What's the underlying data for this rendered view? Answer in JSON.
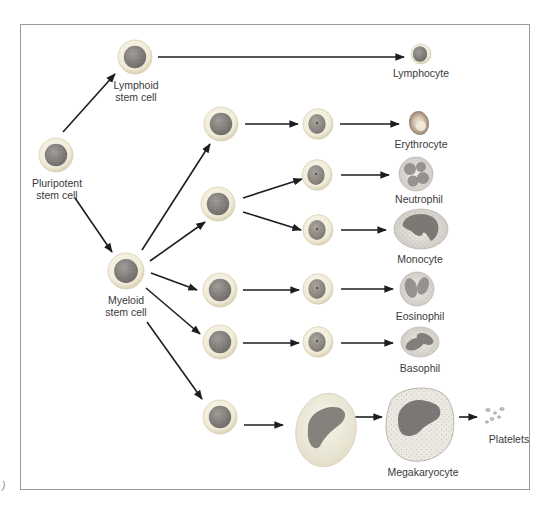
{
  "diagram": {
    "corner_mark": ")",
    "colors": {
      "frame": "#9a9a9a",
      "arrow": "#1e1e1e",
      "cell_halo": "#f1ecd9",
      "cell_halo_edge": "#d8d0b4",
      "stem_nucleus": "#7e7a78",
      "progenitor_nucleus": "#8c8882",
      "erythrocyte": "#b69a86",
      "granulocyte_body": "#e4e0dc",
      "granulocyte_lobes": "#8a8583",
      "megakaryoblast_cytoplasm": "#f2eee0",
      "megakaryocyte_nucleus": "#7a7474",
      "label_text": "#3a3a3a"
    },
    "nodes": [
      {
        "id": "pluripotent",
        "type": "stem",
        "x": 56,
        "y": 155,
        "r": 17,
        "label": "Pluripotent\nstem cell",
        "lx": 57,
        "ly": 177
      },
      {
        "id": "lymphoid",
        "type": "stem",
        "x": 135,
        "y": 57,
        "r": 17,
        "label": "Lymphoid\nstem cell",
        "lx": 136,
        "ly": 79
      },
      {
        "id": "myeloid",
        "type": "stem",
        "x": 126,
        "y": 271,
        "r": 18,
        "label": "Myeloid\nstem cell",
        "lx": 126,
        "ly": 294
      },
      {
        "id": "m1",
        "type": "stem",
        "x": 221,
        "y": 124,
        "r": 17
      },
      {
        "id": "m2",
        "type": "stem",
        "x": 218,
        "y": 204,
        "r": 17
      },
      {
        "id": "m3",
        "type": "stem",
        "x": 220,
        "y": 290,
        "r": 17
      },
      {
        "id": "m4",
        "type": "stem",
        "x": 220,
        "y": 342,
        "r": 17
      },
      {
        "id": "m5",
        "type": "stem",
        "x": 220,
        "y": 417,
        "r": 17
      },
      {
        "id": "p1",
        "type": "progenitor",
        "x": 318,
        "y": 124,
        "r": 15
      },
      {
        "id": "p2",
        "type": "progenitor",
        "x": 317,
        "y": 175,
        "r": 15
      },
      {
        "id": "p3",
        "type": "progenitor",
        "x": 318,
        "y": 230,
        "r": 15
      },
      {
        "id": "p4",
        "type": "progenitor",
        "x": 318,
        "y": 289,
        "r": 15
      },
      {
        "id": "p5",
        "type": "progenitor",
        "x": 318,
        "y": 342,
        "r": 15
      },
      {
        "id": "megakaryoblast",
        "type": "megakaryoblast",
        "x": 326,
        "y": 430
      },
      {
        "id": "lymphocyte",
        "type": "lymphocyte",
        "x": 421,
        "y": 54,
        "label": "Lymphocyte",
        "lx": 421,
        "ly": 67
      },
      {
        "id": "erythrocyte",
        "type": "erythrocyte",
        "x": 419,
        "y": 123,
        "label": "Erythrocyte",
        "lx": 421,
        "ly": 138
      },
      {
        "id": "neutrophil",
        "type": "neutrophil",
        "x": 416,
        "y": 174,
        "label": "Neutrophil",
        "lx": 419,
        "ly": 193
      },
      {
        "id": "monocyte",
        "type": "monocyte",
        "x": 421,
        "y": 229,
        "label": "Monocyte",
        "lx": 420,
        "ly": 253
      },
      {
        "id": "eosinophil",
        "type": "eosinophil",
        "x": 417,
        "y": 289,
        "label": "Eosinophil",
        "lx": 420,
        "ly": 310
      },
      {
        "id": "basophil",
        "type": "basophil",
        "x": 420,
        "y": 342,
        "label": "Basophil",
        "lx": 420,
        "ly": 362
      },
      {
        "id": "megakaryocyte",
        "type": "megakaryocyte",
        "x": 420,
        "y": 423,
        "label": "Megakaryocyte",
        "lx": 423,
        "ly": 466
      },
      {
        "id": "platelets",
        "type": "platelets",
        "x": 495,
        "y": 414,
        "label": "Platelets",
        "lx": 509,
        "ly": 433
      }
    ],
    "arrows": [
      {
        "from": "pluripotent",
        "x1": 63,
        "y1": 132,
        "x2": 115,
        "y2": 74
      },
      {
        "from": "pluripotent",
        "x1": 75,
        "y1": 198,
        "x2": 112,
        "y2": 252
      },
      {
        "from": "lymphoid",
        "x1": 158,
        "y1": 57,
        "x2": 404,
        "y2": 57
      },
      {
        "from": "myeloid",
        "x1": 142,
        "y1": 250,
        "x2": 210,
        "y2": 144
      },
      {
        "from": "myeloid",
        "x1": 150,
        "y1": 261,
        "x2": 205,
        "y2": 222
      },
      {
        "from": "myeloid",
        "x1": 151,
        "y1": 273,
        "x2": 197,
        "y2": 290
      },
      {
        "from": "myeloid",
        "x1": 146,
        "y1": 288,
        "x2": 200,
        "y2": 334
      },
      {
        "from": "myeloid",
        "x1": 147,
        "y1": 322,
        "x2": 202,
        "y2": 399
      },
      {
        "from": "m1",
        "x1": 245,
        "y1": 124,
        "x2": 298,
        "y2": 124
      },
      {
        "from": "m2",
        "x1": 243,
        "y1": 198,
        "x2": 302,
        "y2": 179
      },
      {
        "from": "m2",
        "x1": 243,
        "y1": 212,
        "x2": 301,
        "y2": 230
      },
      {
        "from": "m3",
        "x1": 243,
        "y1": 290,
        "x2": 299,
        "y2": 290
      },
      {
        "from": "m4",
        "x1": 243,
        "y1": 343,
        "x2": 299,
        "y2": 343
      },
      {
        "from": "m5",
        "x1": 244,
        "y1": 425,
        "x2": 283,
        "y2": 425
      },
      {
        "from": "p1",
        "x1": 340,
        "y1": 124,
        "x2": 399,
        "y2": 124
      },
      {
        "from": "p2",
        "x1": 341,
        "y1": 175,
        "x2": 389,
        "y2": 175
      },
      {
        "from": "p3",
        "x1": 341,
        "y1": 230,
        "x2": 386,
        "y2": 230
      },
      {
        "from": "p4",
        "x1": 341,
        "y1": 289,
        "x2": 393,
        "y2": 289
      },
      {
        "from": "p5",
        "x1": 341,
        "y1": 343,
        "x2": 393,
        "y2": 343
      },
      {
        "from": "megakaryoblast",
        "x1": 355,
        "y1": 417,
        "x2": 382,
        "y2": 417
      },
      {
        "from": "megakaryocyte",
        "x1": 459,
        "y1": 417,
        "x2": 477,
        "y2": 417
      }
    ]
  }
}
